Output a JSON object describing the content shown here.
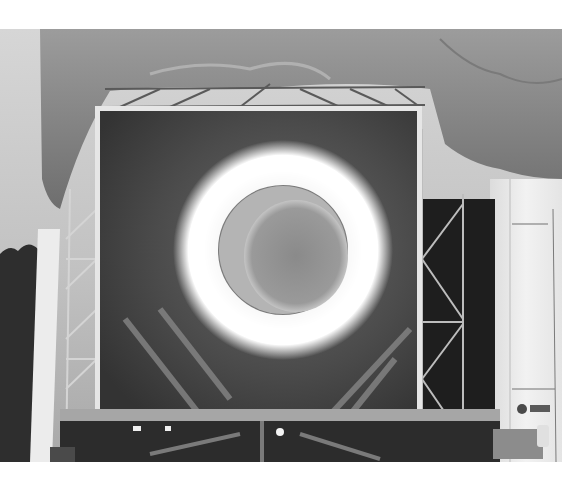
{
  "image": {
    "kind": "photograph",
    "tone": "grayscale",
    "subject": "large rectangular projection screen on steel scaffold under tarp, showing a glowing ring",
    "frame": {
      "x": 0,
      "y": 29,
      "width": 562,
      "height": 433
    },
    "colors": {
      "page_background": "#ffffff",
      "sky": "#cfcfcf",
      "tarp": "#8a8a8a",
      "screen_dark": "#3a3a3a",
      "ring_glow": "#ffffff",
      "inner_disk": "#8c8c8c",
      "scaffold": "#d8d8d8",
      "trees": "#2a2a2a",
      "right_wall": "#eeeeee"
    },
    "ring": {
      "cx": 283,
      "cy": 221,
      "outer_r": 98,
      "inner_r": 62
    },
    "inner_disk": {
      "cx": 296,
      "cy": 227,
      "rx": 52,
      "ry": 56
    },
    "screen": {
      "x": 97,
      "y": 79,
      "width": 323,
      "height": 310
    }
  }
}
